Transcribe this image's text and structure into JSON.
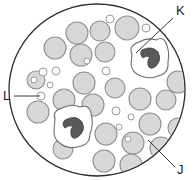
{
  "figure": {
    "colors": {
      "background": "#ffffff",
      "field_outline": "#2b2b2b",
      "cell_fill": "#d7d7d7",
      "cell_stroke": "#8f8f8f",
      "vesicle_fill": "#ffffff",
      "vesicle_stroke": "#9a9a9a",
      "amoeba_fill": "#ffffff",
      "amoeba_stroke": "#6d6d6d",
      "nucleus_fill": "#595959",
      "nucleus_stroke": "#3d3d3d",
      "leader_line": "#3a3a3a",
      "label_text": "#1a1a1a"
    },
    "field": {
      "name": "field-of-view",
      "cx": 97,
      "cy": 90,
      "rx": 88,
      "ry": 86
    },
    "labels": [
      {
        "id": "label-k",
        "text": "K",
        "text_x": 176,
        "text_y": 15,
        "leader": "M 173 18 L 136 53",
        "target": "amoeboid-cell-upper-right"
      },
      {
        "id": "label-l",
        "text": "L",
        "text_x": 3,
        "text_y": 100,
        "leader": "M 14 96 L 40 96",
        "target": "small-vesicle"
      },
      {
        "id": "label-j",
        "text": "J",
        "text_x": 177,
        "text_y": 174,
        "leader": "M 175 167 L 148 140",
        "target": "round-cell-lower-right"
      }
    ],
    "cells": [
      {
        "name": "round-cell",
        "cx": 77,
        "cy": 33,
        "r": 11
      },
      {
        "name": "round-cell",
        "cx": 100,
        "cy": 31,
        "r": 10
      },
      {
        "name": "round-cell",
        "cx": 127,
        "cy": 28,
        "r": 12
      },
      {
        "name": "round-cell",
        "cx": 55,
        "cy": 48,
        "r": 11
      },
      {
        "name": "round-cell",
        "cx": 81,
        "cy": 55,
        "r": 11
      },
      {
        "name": "round-cell",
        "cx": 105,
        "cy": 52,
        "r": 10
      },
      {
        "name": "round-cell",
        "cx": 36,
        "cy": 80,
        "r": 9
      },
      {
        "name": "round-cell",
        "cx": 84,
        "cy": 83,
        "r": 11
      },
      {
        "name": "round-cell",
        "cx": 115,
        "cy": 88,
        "r": 10
      },
      {
        "name": "round-cell",
        "cx": 178,
        "cy": 82,
        "r": 11
      },
      {
        "name": "round-cell",
        "cx": 64,
        "cy": 100,
        "r": 11
      },
      {
        "name": "round-cell",
        "cx": 93,
        "cy": 105,
        "r": 11
      },
      {
        "name": "round-cell",
        "cx": 140,
        "cy": 99,
        "r": 11
      },
      {
        "name": "round-cell",
        "cx": 166,
        "cy": 100,
        "r": 10
      },
      {
        "name": "round-cell",
        "cx": 38,
        "cy": 112,
        "r": 11
      },
      {
        "name": "round-cell",
        "cx": 150,
        "cy": 124,
        "r": 11
      },
      {
        "name": "round-cell",
        "cx": 178,
        "cy": 128,
        "r": 10
      },
      {
        "name": "round-cell",
        "cx": 106,
        "cy": 134,
        "r": 11
      },
      {
        "name": "round-cell",
        "cx": 133,
        "cy": 143,
        "r": 11
      },
      {
        "name": "round-cell",
        "cx": 161,
        "cy": 148,
        "r": 11
      },
      {
        "name": "round-cell",
        "cx": 104,
        "cy": 161,
        "r": 11
      },
      {
        "name": "round-cell",
        "cx": 131,
        "cy": 165,
        "r": 11
      },
      {
        "name": "round-cell",
        "cx": 63,
        "cy": 149,
        "r": 10
      }
    ],
    "vesicles": [
      {
        "name": "small-vesicle",
        "cx": 110,
        "cy": 19,
        "r": 4
      },
      {
        "name": "small-vesicle",
        "cx": 146,
        "cy": 28,
        "r": 4
      },
      {
        "name": "small-vesicle",
        "cx": 43,
        "cy": 72,
        "r": 4
      },
      {
        "name": "small-vesicle",
        "cx": 56,
        "cy": 71,
        "r": 4
      },
      {
        "name": "small-vesicle",
        "cx": 34,
        "cy": 80,
        "r": 3
      },
      {
        "name": "small-vesicle",
        "cx": 50,
        "cy": 85,
        "r": 3
      },
      {
        "name": "small-vesicle",
        "cx": 41,
        "cy": 96,
        "r": 4
      },
      {
        "name": "small-vesicle",
        "cx": 106,
        "cy": 71,
        "r": 4
      },
      {
        "name": "small-vesicle",
        "cx": 116,
        "cy": 111,
        "r": 4
      },
      {
        "name": "small-vesicle",
        "cx": 131,
        "cy": 117,
        "r": 3
      },
      {
        "name": "small-vesicle",
        "cx": 119,
        "cy": 127,
        "r": 3
      },
      {
        "name": "small-vesicle",
        "cx": 128,
        "cy": 139,
        "r": 3
      },
      {
        "name": "small-vesicle",
        "cx": 87,
        "cy": 61,
        "r": 3
      }
    ],
    "amoeboid_cells": [
      {
        "name": "amoeboid-cell-upper-right",
        "outline": "M 132 54 Q 128 46 139 42 Q 148 37 156 40 Q 163 36 166 43 Q 170 52 168 62 Q 169 72 161 75 Q 150 80 141 76 Q 132 73 131 64 Z",
        "nucleus": "M 142 50 Q 152 45 158 52 Q 162 60 156 66 Q 150 71 148 65 Q 147 60 150 57 Q 146 55 143 58 Q 139 54 142 50 Z"
      },
      {
        "name": "amoeboid-cell-lower-left",
        "outline": "M 55 119 Q 52 111 62 108 Q 72 103 80 107 Q 89 104 91 113 Q 94 124 90 134 Q 90 144 81 146 Q 69 150 61 144 Q 53 139 54 130 Z",
        "nucleus": "M 65 120 Q 76 114 82 122 Q 86 130 79 136 Q 73 141 71 135 Q 70 129 73 126 Q 68 125 65 128 Q 61 124 65 120 Z"
      }
    ]
  }
}
